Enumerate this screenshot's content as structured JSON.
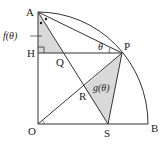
{
  "diagram": {
    "type": "geometry",
    "points": {
      "A": {
        "label": "A",
        "x": 38,
        "y": 12
      },
      "O": {
        "label": "O",
        "x": 38,
        "y": 124
      },
      "B": {
        "label": "B",
        "x": 148,
        "y": 124
      },
      "H": {
        "label": "H",
        "x": 38,
        "y": 53
      },
      "P": {
        "label": "P",
        "x": 122,
        "y": 53
      },
      "Q": {
        "label": "Q",
        "x": 63,
        "y": 53
      },
      "R": {
        "label": "R",
        "x": 84,
        "y": 87
      },
      "S": {
        "label": "S",
        "x": 108,
        "y": 124
      }
    },
    "labels": {
      "A": "A",
      "O": "O",
      "B": "B",
      "H": "H",
      "P": "P",
      "Q": "Q",
      "R": "R",
      "S": "S",
      "theta": "θ",
      "f_theta": "f(θ)",
      "g_theta": "g(θ)"
    },
    "colors": {
      "stroke": "#333333",
      "shade": "#d9d9d9"
    }
  }
}
